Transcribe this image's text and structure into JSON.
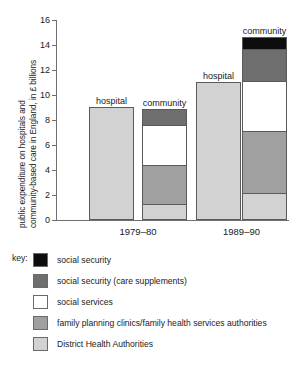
{
  "chart_data": {
    "type": "bar",
    "subtype": "stacked-bar-grouped",
    "title": "",
    "xlabel": "",
    "ylabel": "public expenditure on hospitals and community-based care in England, in £ billions",
    "ylabel_line1": "public expenditure on hospitals and",
    "ylabel_line2": "community-based care in England, in £ billions",
    "ylim": [
      0,
      16
    ],
    "yticks": [
      0,
      2,
      4,
      6,
      8,
      10,
      12,
      14,
      16
    ],
    "ytick_labels": [
      "0",
      "2",
      "4",
      "6",
      "8",
      "10",
      "12",
      "14",
      "16"
    ],
    "grid": false,
    "legend_position": "below",
    "categories": [
      "1979–80",
      "1989–90"
    ],
    "bar_labels": [
      "hospital",
      "community"
    ],
    "series": [
      {
        "name": "District Health Authorities",
        "color": "#d2d2d2",
        "values": {
          "1979–80 hospital": 9.0,
          "1979–80 community": 1.1,
          "1989–90 hospital": 11.0,
          "1989–90 community": 2.0
        }
      },
      {
        "name": "family planning clinics/family health services authorities",
        "color": "#a0a0a0",
        "values": {
          "1979–80 hospital": 0,
          "1979–80 community": 3.2,
          "1989–90 hospital": 0,
          "1989–90 community": 5.0
        }
      },
      {
        "name": "social services",
        "color": "#ffffff",
        "values": {
          "1979–80 hospital": 0,
          "1979–80 community": 3.2,
          "1989–90 hospital": 0,
          "1989–90 community": 4.0
        }
      },
      {
        "name": "social security (care supplements)",
        "color": "#6e6e6e",
        "values": {
          "1979–80 hospital": 0,
          "1979–80 community": 1.3,
          "1989–90 hospital": 0,
          "1989–90 community": 2.6
        }
      },
      {
        "name": "social security",
        "color": "#0d0d0d",
        "values": {
          "1979–80 hospital": 0,
          "1979–80 community": 0,
          "1989–90 hospital": 0,
          "1989–90 community": 1.0
        }
      }
    ],
    "bars": [
      {
        "group": "1979–80",
        "label": "hospital",
        "total": 9.0,
        "segments": [
          {
            "name": "District Health Authorities",
            "value": 9.0,
            "from": 0,
            "to": 9.0,
            "color": "#d2d2d2"
          }
        ]
      },
      {
        "group": "1979–80",
        "label": "community",
        "total": 8.8,
        "segments": [
          {
            "name": "District Health Authorities",
            "value": 1.1,
            "from": 0,
            "to": 1.1,
            "color": "#d2d2d2"
          },
          {
            "name": "family planning clinics/family health services authorities",
            "value": 3.2,
            "from": 1.1,
            "to": 4.3,
            "color": "#a0a0a0"
          },
          {
            "name": "social services",
            "value": 3.2,
            "from": 4.3,
            "to": 7.5,
            "color": "#ffffff"
          },
          {
            "name": "social security (care supplements)",
            "value": 1.3,
            "from": 7.5,
            "to": 8.8,
            "color": "#6e6e6e"
          }
        ]
      },
      {
        "group": "1989–90",
        "label": "hospital",
        "total": 11.0,
        "segments": [
          {
            "name": "District Health Authorities",
            "value": 11.0,
            "from": 0,
            "to": 11.0,
            "color": "#d2d2d2"
          }
        ]
      },
      {
        "group": "1989–90",
        "label": "community",
        "total": 14.6,
        "segments": [
          {
            "name": "District Health Authorities",
            "value": 2.0,
            "from": 0,
            "to": 2.0,
            "color": "#d2d2d2"
          },
          {
            "name": "family planning clinics/family health services authorities",
            "value": 5.0,
            "from": 2.0,
            "to": 7.0,
            "color": "#a0a0a0"
          },
          {
            "name": "social services",
            "value": 4.0,
            "from": 7.0,
            "to": 11.0,
            "color": "#ffffff"
          },
          {
            "name": "social security (care supplements)",
            "value": 2.6,
            "from": 11.0,
            "to": 13.6,
            "color": "#6e6e6e"
          },
          {
            "name": "social security",
            "value": 1.0,
            "from": 13.6,
            "to": 14.6,
            "color": "#0d0d0d"
          }
        ]
      }
    ],
    "legend": {
      "key_label": "key:",
      "entries": [
        {
          "label": "social security",
          "color": "#0d0d0d"
        },
        {
          "label": "social security (care supplements)",
          "color": "#6e6e6e"
        },
        {
          "label": "social services",
          "color": "#ffffff"
        },
        {
          "label": "family planning clinics/family health services authorities",
          "color": "#a0a0a0"
        },
        {
          "label": "District Health Authorities",
          "color": "#d2d2d2"
        }
      ]
    }
  }
}
